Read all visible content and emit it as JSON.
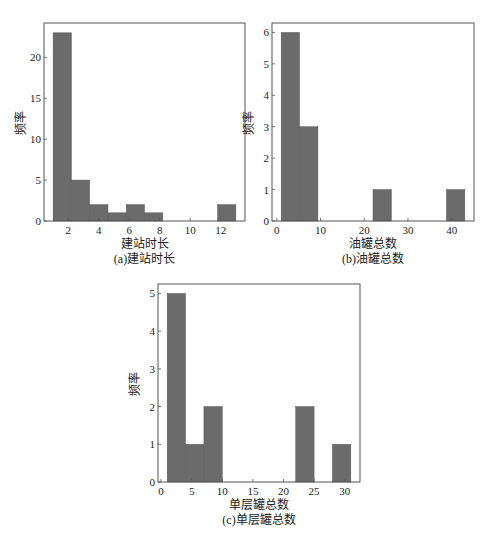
{
  "chart_data": [
    {
      "id": "a",
      "type": "bar",
      "subtype": "histogram",
      "title": "",
      "caption": "(a)建站时长",
      "xlabel": "建站时长",
      "ylabel": "频率",
      "bin_edges": [
        1.0,
        2.2,
        3.4,
        4.6,
        5.8,
        7.0,
        8.2,
        9.4,
        10.6,
        11.8,
        13.0
      ],
      "values": [
        23,
        5,
        2,
        1,
        2,
        1,
        0,
        0,
        0,
        2
      ],
      "xticks": [
        2,
        4,
        6,
        8,
        10,
        12
      ],
      "yticks": [
        0,
        5,
        10,
        15,
        20
      ],
      "xlim": [
        0.4,
        13.6
      ],
      "ylim": [
        0,
        24.2
      ],
      "grid": false,
      "bar_color": "#6b6b6b",
      "layout": {
        "left": 44,
        "top": 23,
        "width": 201,
        "height": 198
      }
    },
    {
      "id": "b",
      "type": "bar",
      "subtype": "histogram",
      "title": "",
      "caption": "(b)油罐总数",
      "xlabel": "油罐总数",
      "ylabel": "频率",
      "bin_edges": [
        1.0,
        5.2,
        9.4,
        13.6,
        17.8,
        22.0,
        26.2,
        30.4,
        34.6,
        38.8,
        43.0
      ],
      "values": [
        6,
        3,
        0,
        0,
        0,
        1,
        0,
        0,
        0,
        1
      ],
      "xticks": [
        0,
        10,
        20,
        30,
        40
      ],
      "yticks": [
        0,
        1,
        2,
        3,
        4,
        5,
        6
      ],
      "xlim": [
        -1.1,
        45.1
      ],
      "ylim": [
        0,
        6.3
      ],
      "grid": false,
      "bar_color": "#6b6b6b",
      "layout": {
        "left": 272,
        "top": 23,
        "width": 202,
        "height": 198
      }
    },
    {
      "id": "c",
      "type": "bar",
      "subtype": "histogram",
      "title": "",
      "caption": "(c)单层罐总数",
      "xlabel": "单层罐总数",
      "ylabel": "频率",
      "bin_edges": [
        1.0,
        4.0,
        7.0,
        10.0,
        13.0,
        16.0,
        19.0,
        22.0,
        25.0,
        28.0,
        31.0
      ],
      "values": [
        5,
        1,
        2,
        0,
        0,
        0,
        0,
        2,
        0,
        1
      ],
      "xticks": [
        0,
        5,
        10,
        15,
        20,
        25,
        30
      ],
      "yticks": [
        0,
        1,
        2,
        3,
        4,
        5
      ],
      "xlim": [
        -0.5,
        32.5
      ],
      "ylim": [
        0,
        5.25
      ],
      "grid": false,
      "bar_color": "#6b6b6b",
      "layout": {
        "left": 158,
        "top": 284,
        "width": 202,
        "height": 198
      }
    }
  ]
}
